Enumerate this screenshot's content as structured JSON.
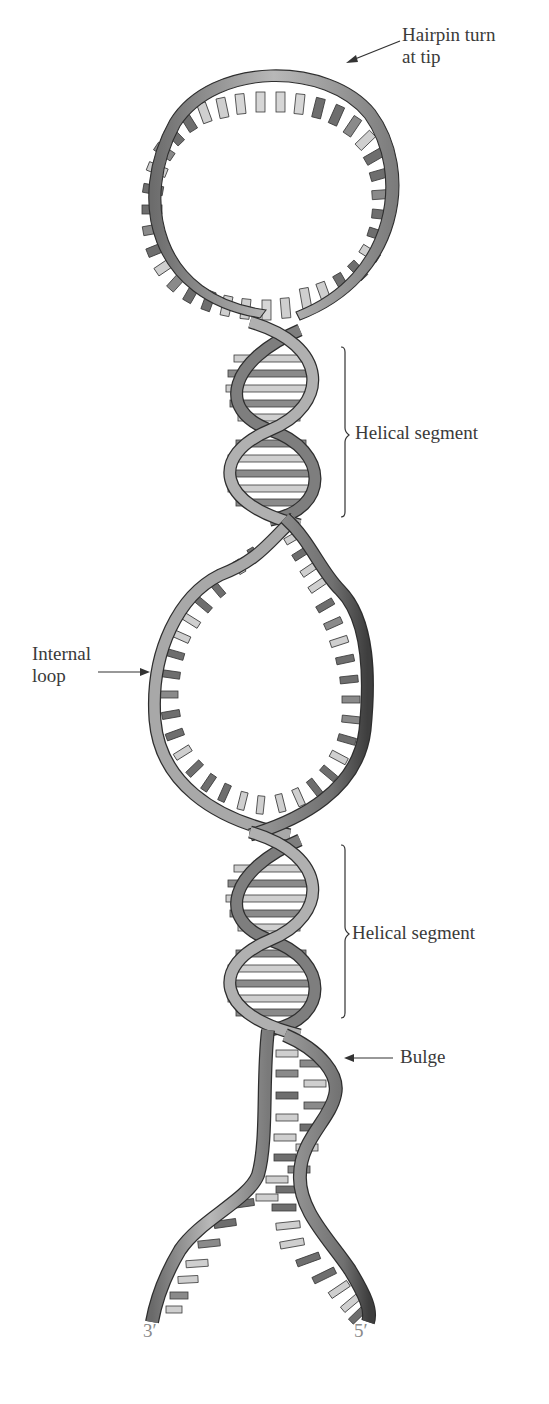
{
  "figure": {
    "colors": {
      "strand_light": "#b4b4b4",
      "strand_mid": "#8c8c8c",
      "strand_dark": "#555555",
      "outline": "#2e2e2e",
      "base_dark": "#6e6e6e",
      "base_light": "#cdcdcd",
      "label_text": "#3a3a3a",
      "end_label_text": "#8a8a8a"
    }
  },
  "labels": {
    "hairpin": {
      "line1": "Hairpin turn",
      "line2": "at tip"
    },
    "helical_segment_top": "Helical segment",
    "internal_loop": {
      "line1": "Internal",
      "line2": "loop"
    },
    "helical_segment_bottom": "Helical segment",
    "bulge": "Bulge",
    "end_3prime": "3′",
    "end_5prime": "5′"
  }
}
